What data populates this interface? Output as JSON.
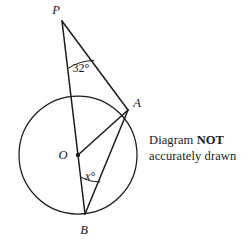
{
  "diagram": {
    "type": "circle-theorem-geometry",
    "note": {
      "line1_prefix": "Diagram ",
      "line1_strong": "NOT",
      "line2": "accurately drawn"
    },
    "stroke_color": "#1a1a1a",
    "background_color": "#ffffff",
    "circle": {
      "center_label": "O",
      "cx": 78,
      "cy": 155,
      "r": 59
    },
    "points": [
      {
        "id": "P",
        "label": "P",
        "x": 62,
        "y": 21,
        "label_x": 56,
        "label_y": 14
      },
      {
        "id": "A",
        "label": "A",
        "x": 128,
        "y": 110,
        "label_x": 135,
        "label_y": 104
      },
      {
        "id": "B",
        "label": "B",
        "x": 85,
        "y": 214,
        "label_x": 83,
        "label_y": 231
      },
      {
        "id": "O",
        "label": "O",
        "x": 78,
        "y": 155,
        "label_x": 62,
        "label_y": 159
      }
    ],
    "segments": [
      {
        "name": "PB",
        "from": "P",
        "to": "B"
      },
      {
        "name": "PA",
        "from": "P",
        "to": "A"
      },
      {
        "name": "OA",
        "from": "O",
        "to": "A"
      },
      {
        "name": "AB",
        "from": "A",
        "to": "B"
      }
    ],
    "angles": [
      {
        "name": "angle-at-P",
        "label": "32°",
        "vertex": "P",
        "label_x": 70,
        "label_y": 70
      },
      {
        "name": "angle-at-B",
        "label": "x°",
        "vertex": "B",
        "label_x": 85,
        "label_y": 178
      }
    ]
  }
}
